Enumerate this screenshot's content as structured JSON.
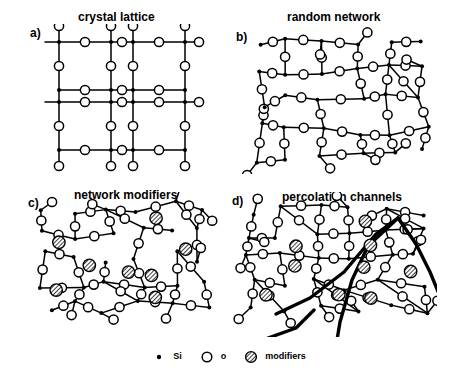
{
  "figure": {
    "width": 456,
    "height": 375,
    "background": "#ffffff",
    "ink": "#000000"
  },
  "panels": [
    {
      "id": "a",
      "label": "a)",
      "title": "crystal lattice",
      "label_x": 30,
      "label_y": 26,
      "title_x": 78,
      "title_y": 10,
      "box": {
        "x": 30,
        "y": 24,
        "w": 180,
        "h": 140
      }
    },
    {
      "id": "b",
      "label": "b)",
      "title": "random network",
      "label_x": 236,
      "label_y": 30,
      "title_x": 287,
      "title_y": 10,
      "box": {
        "x": 236,
        "y": 24,
        "w": 200,
        "h": 140
      }
    },
    {
      "id": "c",
      "label": "c)",
      "title": "network modifiers",
      "label_x": 28,
      "label_y": 196,
      "title_x": 74,
      "title_y": 188,
      "box": {
        "x": 28,
        "y": 192,
        "w": 190,
        "h": 145
      }
    },
    {
      "id": "d",
      "label": "d)",
      "title": "percolation channels",
      "label_x": 232,
      "label_y": 194,
      "title_x": 282,
      "title_y": 190,
      "box": {
        "x": 232,
        "y": 192,
        "w": 205,
        "h": 145
      }
    }
  ],
  "legend": {
    "items": [
      {
        "symbol": "si-dot",
        "label": "Si"
      },
      {
        "symbol": "oxygen-circle",
        "label": "o"
      },
      {
        "symbol": "modifier-hatched-circle",
        "label": "modifiers"
      }
    ]
  },
  "symbols": {
    "si": {
      "name": "si-dot",
      "shape": "filled-square-dot",
      "size": 3.4,
      "fill": "#000000"
    },
    "o": {
      "name": "oxygen-circle",
      "shape": "open-circle",
      "radius": 4.6,
      "stroke": "#000000",
      "fill": "#ffffff",
      "stroke_width": 1.5
    },
    "modifier": {
      "name": "modifier-hatched-circle",
      "shape": "hatched-circle",
      "radius": 6.2,
      "stroke": "#000000",
      "fill": "hatch",
      "stroke_width": 1.4
    },
    "bond": {
      "stroke": "#000000",
      "stroke_width": 1.5
    },
    "channel": {
      "stroke": "#000000",
      "stroke_width": 3.4
    }
  },
  "structures": {
    "crystal_lattice": {
      "type": "ordered-hexagonal",
      "ring_count": 4,
      "ring_cols": 2,
      "ring_rows": 2,
      "cell_w": 74,
      "cell_h": 60,
      "origin_x": 72,
      "origin_y": 56,
      "si_nodes": [
        [
          48,
          42
        ],
        [
          96,
          42
        ],
        [
          48,
          98
        ],
        [
          96,
          98
        ],
        [
          48,
          154
        ],
        [
          96,
          154
        ],
        [
          122,
          42
        ],
        [
          170,
          42
        ],
        [
          122,
          98
        ],
        [
          170,
          98
        ],
        [
          122,
          154
        ],
        [
          170,
          154
        ],
        [
          38,
          70
        ],
        [
          38,
          126
        ],
        [
          106,
          70
        ],
        [
          106,
          126
        ],
        [
          180,
          70
        ],
        [
          180,
          126
        ]
      ],
      "o_nodes": [
        [
          72,
          42
        ],
        [
          72,
          98
        ],
        [
          72,
          154
        ],
        [
          146,
          42
        ],
        [
          146,
          98
        ],
        [
          146,
          154
        ],
        [
          38,
          28
        ],
        [
          38,
          56
        ],
        [
          38,
          84
        ],
        [
          38,
          112
        ],
        [
          38,
          140
        ],
        [
          38,
          168
        ],
        [
          106,
          28
        ],
        [
          106,
          56
        ],
        [
          106,
          84
        ],
        [
          106,
          112
        ],
        [
          106,
          140
        ],
        [
          106,
          168
        ],
        [
          180,
          28
        ],
        [
          180,
          56
        ],
        [
          180,
          84
        ],
        [
          180,
          112
        ],
        [
          180,
          140
        ],
        [
          180,
          168
        ],
        [
          58,
          70
        ],
        [
          58,
          126
        ],
        [
          196,
          70
        ],
        [
          196,
          126
        ]
      ]
    },
    "random_network": {
      "type": "continuous-random-network",
      "ring_sizes": [
        5,
        6,
        6,
        7,
        6,
        5,
        6
      ],
      "node_count_si": 36,
      "node_count_o": 62,
      "dangling_bonds": 9
    },
    "network_modifiers": {
      "type": "modified-random-network",
      "modifier_count": 14,
      "broken_bridges": 14,
      "node_count_si": 30,
      "node_count_o": 55
    },
    "percolation_channels": {
      "type": "modified-random-network-with-channels",
      "modifier_count": 9,
      "channel_count": 5,
      "channel_paths": [
        [
          [
            28,
            104
          ],
          [
            62,
            88
          ],
          [
            96,
            62
          ],
          [
            128,
            24
          ],
          [
            150,
            8
          ]
        ],
        [
          [
            150,
            8
          ],
          [
            120,
            36
          ],
          [
            104,
            70
          ],
          [
            92,
            112
          ],
          [
            86,
            148
          ]
        ],
        [
          [
            150,
            8
          ],
          [
            168,
            34
          ],
          [
            182,
            62
          ],
          [
            196,
            96
          ],
          [
            204,
            130
          ]
        ],
        [
          [
            20,
            128
          ],
          [
            48,
            118
          ],
          [
            66,
            100
          ]
        ],
        [
          [
            196,
            96
          ],
          [
            206,
            120
          ],
          [
            212,
            146
          ]
        ]
      ]
    }
  }
}
